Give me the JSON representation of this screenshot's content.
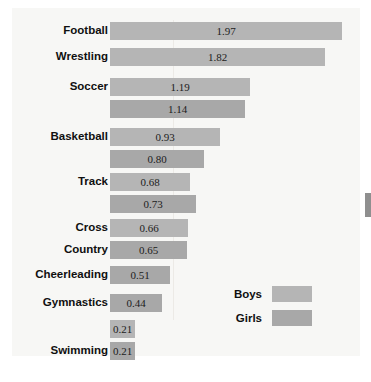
{
  "figure": {
    "background_color": "#f7f7f5",
    "page_color": "#ffffff",
    "caption": ""
  },
  "legend": {
    "position": "inline-mid-right",
    "entries": [
      {
        "label": "Boys",
        "color": "#b5b5b5"
      },
      {
        "label": "Girls",
        "color": "#a8a8a8"
      }
    ]
  },
  "chart_data": {
    "type": "bar",
    "orientation": "horizontal",
    "title": "",
    "xlabel": "",
    "ylabel": "",
    "xlim": [
      0,
      2.1
    ],
    "grid": true,
    "categories": [
      "Football",
      "Wrestling",
      "Soccer",
      "Basketball",
      "Track",
      "Cross Country",
      "Cheerleading",
      "Gymnastics",
      "Swimming"
    ],
    "series": [
      {
        "name": "Boys",
        "color": "#b5b5b5",
        "values": [
          1.97,
          1.82,
          1.19,
          0.93,
          0.68,
          0.66,
          null,
          null,
          0.21
        ]
      },
      {
        "name": "Girls",
        "color": "#a8a8a8",
        "values": [
          null,
          null,
          1.14,
          0.8,
          0.73,
          0.65,
          0.51,
          0.44,
          0.21
        ]
      }
    ],
    "bars": [
      {
        "category": "Football",
        "label_lines": [
          "Football"
        ],
        "series": "Boys",
        "value": 1.97,
        "text": "1.97",
        "top": 14,
        "color": "#b5b5b5"
      },
      {
        "category": "Wrestling",
        "label_lines": [
          "Wrestling"
        ],
        "series": "Boys",
        "value": 1.82,
        "text": "1.82",
        "top": 40,
        "color": "#b5b5b5"
      },
      {
        "category": "Soccer",
        "label_lines": [
          "Soccer"
        ],
        "series": "Boys",
        "value": 1.19,
        "text": "1.19",
        "top": 70,
        "color": "#b5b5b5"
      },
      {
        "category": "Soccer",
        "label_lines": [],
        "series": "Girls",
        "value": 1.14,
        "text": "1.14",
        "top": 92,
        "color": "#a8a8a8"
      },
      {
        "category": "Basketball",
        "label_lines": [
          "Basketball"
        ],
        "series": "Boys",
        "value": 0.93,
        "text": "0.93",
        "top": 120,
        "color": "#b5b5b5"
      },
      {
        "category": "Basketball",
        "label_lines": [],
        "series": "Girls",
        "value": 0.8,
        "text": "0.80",
        "top": 142,
        "color": "#a8a8a8"
      },
      {
        "category": "Track",
        "label_lines": [
          "Track"
        ],
        "series": "Boys",
        "value": 0.68,
        "text": "0.68",
        "top": 165,
        "color": "#b5b5b5"
      },
      {
        "category": "Track",
        "label_lines": [],
        "series": "Girls",
        "value": 0.73,
        "text": "0.73",
        "top": 187,
        "color": "#a8a8a8"
      },
      {
        "category": "Cross Country",
        "label_lines": [
          "Cross"
        ],
        "series": "Boys",
        "value": 0.66,
        "text": "0.66",
        "top": 211,
        "color": "#b5b5b5"
      },
      {
        "category": "Cross Country",
        "label_lines": [
          "Country"
        ],
        "series": "Girls",
        "value": 0.65,
        "text": "0.65",
        "top": 233,
        "color": "#a8a8a8"
      },
      {
        "category": "Cheerleading",
        "label_lines": [
          "Cheerleading"
        ],
        "series": "Girls",
        "value": 0.51,
        "text": "0.51",
        "top": 258,
        "color": "#a8a8a8"
      },
      {
        "category": "Gymnastics",
        "label_lines": [
          "Gymnastics"
        ],
        "series": "Girls",
        "value": 0.44,
        "text": "0.44",
        "top": 286,
        "color": "#a8a8a8"
      },
      {
        "category": "Swimming",
        "label_lines": [],
        "series": "Boys",
        "value": 0.21,
        "text": "0.21",
        "top": 312,
        "color": "#b5b5b5"
      },
      {
        "category": "Swimming",
        "label_lines": [
          "Swimming"
        ],
        "series": "Girls",
        "value": 0.21,
        "text": "0.21",
        "top": 334,
        "color": "#a8a8a8"
      }
    ],
    "scale_px_per_unit": 118,
    "bar_origin_px": 98,
    "gridline_x_px": 161
  }
}
